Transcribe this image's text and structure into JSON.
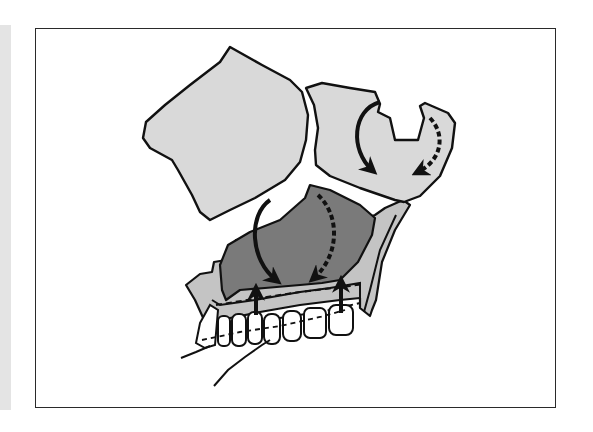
{
  "figure": {
    "kind": "anatomical-diagram",
    "colors": {
      "background": "#ffffff",
      "frame": "#2a2a2a",
      "bone_light": "#d9d9d9",
      "sinus_dark": "#7a7a7a",
      "maxilla_mid": "#c4c4c4",
      "outline": "#111111",
      "teeth": "#ffffff",
      "side_strip": "#e4e4e4"
    },
    "regions": [
      {
        "name": "orbit-block",
        "fill": "bone_light"
      },
      {
        "name": "nasal-block",
        "fill": "bone_light"
      },
      {
        "name": "maxillary-sinus",
        "fill": "sinus_dark"
      },
      {
        "name": "maxilla-alveolar",
        "fill": "maxilla_mid"
      },
      {
        "name": "upper-teeth",
        "count": 8
      }
    ],
    "arrows": [
      {
        "name": "nasal-solid-curve-arrow",
        "style": "solid",
        "direction": "clockwise-down"
      },
      {
        "name": "nasal-dashed-curve-arrow",
        "style": "dashed",
        "direction": "down-left"
      },
      {
        "name": "sinus-solid-curve-arrow",
        "style": "solid",
        "direction": "clockwise-down"
      },
      {
        "name": "sinus-dashed-curve-arrow",
        "style": "dashed",
        "direction": "counterclockwise-down"
      },
      {
        "name": "alveolar-up-arrow-left",
        "style": "solid",
        "direction": "up"
      },
      {
        "name": "alveolar-up-arrow-right",
        "style": "solid",
        "direction": "up"
      }
    ]
  }
}
